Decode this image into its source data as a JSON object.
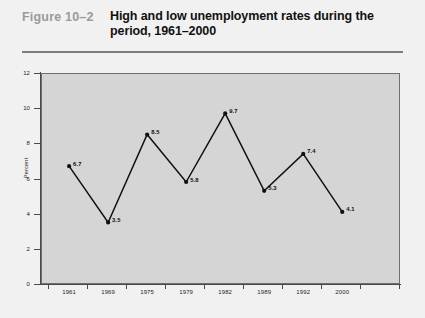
{
  "header": {
    "figure_number": "Figure 10–2",
    "title": "High and low unemployment rates during the period, 1961–2000"
  },
  "chart_data": {
    "type": "line",
    "xlabel": "",
    "ylabel": "Percent",
    "categories": [
      "1961",
      "1969",
      "1975",
      "1979",
      "1982",
      "1989",
      "1992",
      "2000"
    ],
    "values": [
      6.7,
      3.5,
      8.5,
      5.8,
      9.7,
      5.3,
      7.4,
      4.1
    ],
    "point_labels": [
      "6.7",
      "3.5",
      "8.5",
      "5.8",
      "9.7",
      "5.3",
      "7.4",
      "4.1"
    ],
    "y_ticks": [
      "0",
      "2",
      "4",
      "6",
      "8",
      "10",
      "12"
    ],
    "ylim": [
      0,
      12
    ],
    "grid": false,
    "legend": null,
    "series_color": "#111111",
    "plot_background": "#d5d5d5",
    "page_background": "#f1f1f1"
  }
}
